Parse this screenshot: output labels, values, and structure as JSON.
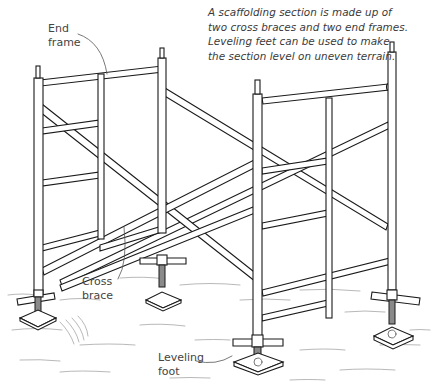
{
  "figure": {
    "caption_lines": [
      "A scaffolding section is made up of",
      "two cross braces and two end frames.",
      "Leveling feet can be used to make",
      "the section level on uneven terrain."
    ],
    "callouts": {
      "end_frame": [
        "End",
        "frame"
      ],
      "cross_brace": [
        "Cross",
        "brace"
      ],
      "leveling_foot": [
        "Leveling",
        "foot"
      ]
    },
    "illustration": "scaffolding-section-line-drawing",
    "colors": {
      "ink": "#1a1a1a",
      "text": "#3a3a3a",
      "background": "#ffffff"
    }
  }
}
